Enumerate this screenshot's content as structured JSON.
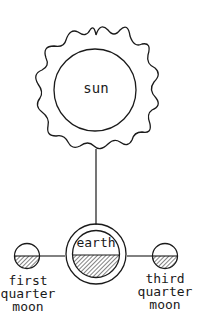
{
  "diagram": {
    "sun": {
      "label": "sun"
    },
    "earth": {
      "label": "earth"
    },
    "moons": [
      {
        "label_lines": [
          "first",
          "quarter",
          "moon"
        ],
        "position": "left"
      },
      {
        "label_lines": [
          "third",
          "quarter",
          "moon"
        ],
        "position": "right"
      }
    ],
    "colors": {
      "stroke": "#1a1a1a",
      "background": "#ffffff"
    }
  }
}
